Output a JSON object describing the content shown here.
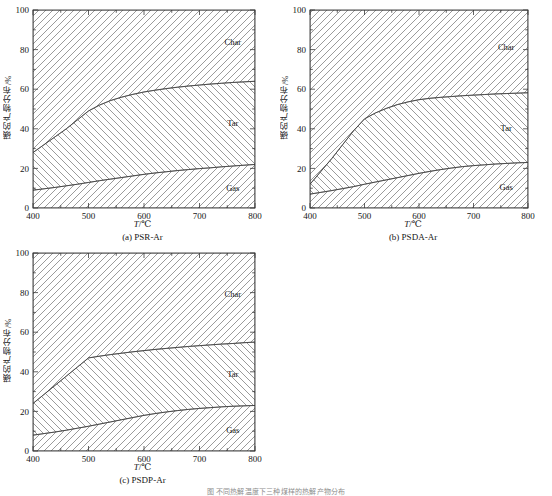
{
  "figure": {
    "axis_label_x": "T/℃",
    "axis_label_x_italic": "T",
    "axis_label_x_rest": "/℃",
    "axis_label_y": "磺的产物分布/%",
    "footnote": "图  不同热解温度下三种煤样的热解产物分布",
    "region_labels": {
      "char": "Char",
      "tar": "Tar",
      "gas": "Gas"
    },
    "x_ticks": [
      "400",
      "500",
      "600",
      "700",
      "800"
    ],
    "y_ticks": [
      "0",
      "20",
      "40",
      "60",
      "80",
      "100"
    ],
    "colors": {
      "axis": "#3a3a3a",
      "hatch": "#7a7a7a",
      "text": "#151515"
    }
  },
  "chart_data": [
    {
      "type": "area",
      "panel": "a",
      "caption": "(a) PSR-Ar",
      "title": "PSR-Ar",
      "xlabel": "T/℃",
      "ylabel": "磺的产物分布/%",
      "xlim": [
        400,
        800
      ],
      "ylim": [
        0,
        100
      ],
      "x": [
        400,
        420,
        440,
        460,
        480,
        500,
        520,
        540,
        560,
        580,
        600,
        620,
        640,
        660,
        680,
        700,
        720,
        740,
        760,
        780,
        800
      ],
      "stacking": "bottom-to-top: Gas, Tar, Char (cumulative boundaries)",
      "boundaries": {
        "gas_top": [
          9.0,
          9.7,
          10.4,
          11.2,
          12.0,
          12.9,
          13.8,
          14.6,
          15.4,
          16.2,
          17.0,
          17.7,
          18.3,
          18.9,
          19.4,
          19.9,
          20.3,
          20.8,
          21.2,
          21.6,
          22.0
        ],
        "tar_top": [
          28.0,
          32.0,
          36.0,
          40.0,
          44.5,
          49.0,
          52.0,
          54.3,
          56.0,
          57.4,
          58.6,
          59.5,
          60.3,
          61.0,
          61.6,
          62.1,
          62.6,
          63.0,
          63.4,
          63.7,
          64.0
        ]
      },
      "series": [
        {
          "name": "Gas",
          "values": [
            9.0,
            9.7,
            10.4,
            11.2,
            12.0,
            12.9,
            13.8,
            14.6,
            15.4,
            16.2,
            17.0,
            17.7,
            18.3,
            18.9,
            19.4,
            19.9,
            20.3,
            20.8,
            21.2,
            21.6,
            22.0
          ]
        },
        {
          "name": "Tar",
          "values": [
            19.0,
            22.3,
            25.6,
            28.8,
            32.5,
            36.1,
            38.2,
            39.7,
            40.6,
            41.2,
            41.6,
            41.8,
            42.0,
            42.1,
            42.2,
            42.2,
            42.3,
            42.2,
            42.2,
            42.1,
            42.0
          ]
        },
        {
          "name": "Char",
          "values": [
            72.0,
            68.0,
            64.0,
            60.0,
            55.5,
            51.0,
            48.0,
            45.7,
            44.0,
            42.6,
            41.4,
            40.5,
            39.7,
            39.0,
            38.4,
            37.9,
            37.4,
            37.0,
            36.6,
            36.3,
            36.0
          ]
        }
      ],
      "grid": false,
      "legend": "in-plot region labels"
    },
    {
      "type": "area",
      "panel": "b",
      "caption": "(b) PSDA-Ar",
      "title": "PSDA-Ar",
      "xlabel": "T/℃",
      "ylabel": "磺的产物分布/%",
      "xlim": [
        400,
        800
      ],
      "ylim": [
        0,
        100
      ],
      "x": [
        400,
        420,
        440,
        460,
        480,
        500,
        520,
        540,
        560,
        580,
        600,
        620,
        640,
        660,
        680,
        700,
        720,
        740,
        760,
        780,
        800
      ],
      "stacking": "bottom-to-top: Gas, Tar, Char (cumulative boundaries)",
      "boundaries": {
        "gas_top": [
          7.0,
          7.9,
          8.8,
          9.8,
          10.8,
          12.0,
          13.1,
          14.2,
          15.3,
          16.4,
          17.5,
          18.5,
          19.4,
          20.2,
          20.9,
          21.4,
          21.8,
          22.2,
          22.5,
          22.8,
          23.0
        ],
        "tar_top": [
          12.0,
          18.5,
          25.0,
          32.0,
          39.0,
          45.0,
          48.0,
          50.3,
          52.2,
          53.6,
          54.7,
          55.4,
          55.9,
          56.3,
          56.7,
          57.0,
          57.3,
          57.6,
          57.8,
          58.0,
          58.2
        ]
      },
      "series": [
        {
          "name": "Gas",
          "values": [
            7.0,
            7.9,
            8.8,
            9.8,
            10.8,
            12.0,
            13.1,
            14.2,
            15.3,
            16.4,
            17.5,
            18.5,
            19.4,
            20.2,
            20.9,
            21.4,
            21.8,
            22.2,
            22.5,
            22.8,
            23.0
          ]
        },
        {
          "name": "Tar",
          "values": [
            5.0,
            10.6,
            16.2,
            22.2,
            28.2,
            33.0,
            34.9,
            36.1,
            36.9,
            37.2,
            37.2,
            36.9,
            36.5,
            36.1,
            35.8,
            35.6,
            35.5,
            35.4,
            35.3,
            35.2,
            35.2
          ]
        },
        {
          "name": "Char",
          "values": [
            88.0,
            81.5,
            75.0,
            68.0,
            61.0,
            55.0,
            52.0,
            49.7,
            47.8,
            46.4,
            45.3,
            44.6,
            44.1,
            43.7,
            43.3,
            43.0,
            42.7,
            42.4,
            42.2,
            42.0,
            41.8
          ]
        }
      ],
      "grid": false,
      "legend": "in-plot region labels"
    },
    {
      "type": "area",
      "panel": "c",
      "caption": "(c) PSDP-Ar",
      "title": "PSDP-Ar",
      "xlabel": "T/℃",
      "ylabel": "磺的产物分布/%",
      "xlim": [
        400,
        800
      ],
      "ylim": [
        0,
        100
      ],
      "x": [
        400,
        420,
        440,
        460,
        480,
        500,
        520,
        540,
        560,
        580,
        600,
        620,
        640,
        660,
        680,
        700,
        720,
        740,
        760,
        780,
        800
      ],
      "stacking": "bottom-to-top: Gas, Tar, Char (cumulative boundaries)",
      "boundaries": {
        "gas_top": [
          8.0,
          8.8,
          9.6,
          10.5,
          11.5,
          12.5,
          13.6,
          14.7,
          15.8,
          16.9,
          18.0,
          18.9,
          19.7,
          20.4,
          21.0,
          21.5,
          21.9,
          22.3,
          22.6,
          22.8,
          23.0
        ],
        "tar_top": [
          24.0,
          28.6,
          33.2,
          37.8,
          42.4,
          47.0,
          47.9,
          48.7,
          49.4,
          50.1,
          50.7,
          51.3,
          51.8,
          52.3,
          52.8,
          53.2,
          53.6,
          54.0,
          54.3,
          54.7,
          55.0
        ]
      },
      "series": [
        {
          "name": "Gas",
          "values": [
            8.0,
            8.8,
            9.6,
            10.5,
            11.5,
            12.5,
            13.6,
            14.7,
            15.8,
            16.9,
            18.0,
            18.9,
            19.7,
            20.4,
            21.0,
            21.5,
            21.9,
            22.3,
            22.6,
            22.8,
            23.0
          ]
        },
        {
          "name": "Tar",
          "values": [
            16.0,
            19.8,
            23.6,
            27.3,
            30.9,
            34.5,
            34.3,
            34.0,
            33.6,
            33.2,
            32.7,
            32.4,
            32.1,
            31.9,
            31.8,
            31.7,
            31.7,
            31.7,
            31.7,
            31.9,
            32.0
          ]
        },
        {
          "name": "Char",
          "values": [
            76.0,
            71.4,
            66.8,
            62.2,
            57.6,
            53.0,
            52.1,
            51.3,
            50.6,
            49.9,
            49.3,
            48.7,
            48.2,
            47.7,
            47.2,
            46.8,
            46.4,
            46.0,
            45.7,
            45.3,
            45.0
          ]
        }
      ],
      "grid": false,
      "legend": "in-plot region labels"
    }
  ]
}
